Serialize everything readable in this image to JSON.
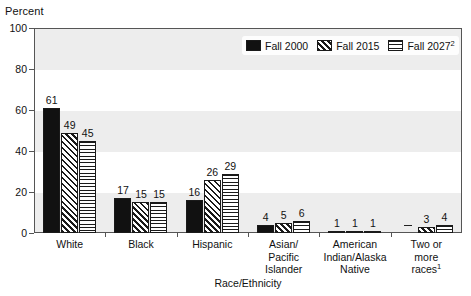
{
  "chart_data": {
    "type": "bar",
    "title": "",
    "xlabel": "Race/Ethnicity",
    "ylabel": "Percent",
    "ylim": [
      0,
      100
    ],
    "ytick_labels": [
      "0",
      "20",
      "40",
      "60",
      "80",
      "100"
    ],
    "ytick_values": [
      0,
      20,
      40,
      60,
      80,
      100
    ],
    "grid": false,
    "banded_background": true,
    "legend_position": "top-right",
    "categories": [
      "White",
      "Black",
      "Hispanic",
      "Asian/ Pacific Islander",
      "American Indian/Alaska Native",
      "Two or more races"
    ],
    "series": [
      {
        "name": "Fall 2000",
        "pattern": "solid",
        "values": [
          61,
          17,
          16,
          4,
          1,
          null
        ],
        "labels": [
          "61",
          "17",
          "16",
          "4",
          "1",
          "—"
        ]
      },
      {
        "name": "Fall 2015",
        "pattern": "diagonal",
        "values": [
          49,
          15,
          26,
          5,
          1,
          3
        ],
        "labels": [
          "49",
          "15",
          "26",
          "5",
          "1",
          "3"
        ]
      },
      {
        "name": "Fall 2027",
        "pattern": "horizontal",
        "values": [
          45,
          15,
          29,
          6,
          1,
          4
        ],
        "labels": [
          "45",
          "15",
          "29",
          "6",
          "1",
          "4"
        ]
      }
    ]
  },
  "axes": {
    "y_title": "Percent",
    "x_title": "Race/Ethnicity",
    "y_ticks": [
      {
        "label": "100",
        "value": 100
      },
      {
        "label": "80",
        "value": 80
      },
      {
        "label": "60",
        "value": 60
      },
      {
        "label": "40",
        "value": 40
      },
      {
        "label": "20",
        "value": 20
      },
      {
        "label": "0",
        "value": 0
      }
    ]
  },
  "legend": {
    "items": [
      {
        "label": "Fall 2000",
        "sup": "",
        "pattern": "solid"
      },
      {
        "label": "Fall 2015",
        "sup": "",
        "pattern": "diag"
      },
      {
        "label": "Fall 2027",
        "sup": "2",
        "pattern": "horiz"
      }
    ]
  },
  "groups": [
    {
      "id": "white",
      "label_lines": [
        "White"
      ],
      "sup": "",
      "bars": [
        {
          "series": "Fall 2000",
          "pattern": "solid",
          "value": 61,
          "label": "61"
        },
        {
          "series": "Fall 2015",
          "pattern": "diag",
          "value": 49,
          "label": "49"
        },
        {
          "series": "Fall 2027",
          "pattern": "horiz",
          "value": 45,
          "label": "45"
        }
      ]
    },
    {
      "id": "black",
      "label_lines": [
        "Black"
      ],
      "sup": "",
      "bars": [
        {
          "series": "Fall 2000",
          "pattern": "solid",
          "value": 17,
          "label": "17"
        },
        {
          "series": "Fall 2015",
          "pattern": "diag",
          "value": 15,
          "label": "15"
        },
        {
          "series": "Fall 2027",
          "pattern": "horiz",
          "value": 15,
          "label": "15"
        }
      ]
    },
    {
      "id": "hispanic",
      "label_lines": [
        "Hispanic"
      ],
      "sup": "",
      "bars": [
        {
          "series": "Fall 2000",
          "pattern": "solid",
          "value": 16,
          "label": "16"
        },
        {
          "series": "Fall 2015",
          "pattern": "diag",
          "value": 26,
          "label": "26"
        },
        {
          "series": "Fall 2027",
          "pattern": "horiz",
          "value": 29,
          "label": "29"
        }
      ]
    },
    {
      "id": "asian-pacific-islander",
      "label_lines": [
        "Asian/",
        "Pacific",
        "Islander"
      ],
      "sup": "",
      "bars": [
        {
          "series": "Fall 2000",
          "pattern": "solid",
          "value": 4,
          "label": "4"
        },
        {
          "series": "Fall 2015",
          "pattern": "diag",
          "value": 5,
          "label": "5"
        },
        {
          "series": "Fall 2027",
          "pattern": "horiz",
          "value": 6,
          "label": "6"
        }
      ]
    },
    {
      "id": "american-indian-alaska-native",
      "label_lines": [
        "American",
        "Indian/Alaska",
        "Native"
      ],
      "sup": "",
      "bars": [
        {
          "series": "Fall 2000",
          "pattern": "solid",
          "value": 1,
          "label": "1"
        },
        {
          "series": "Fall 2015",
          "pattern": "diag",
          "value": 1,
          "label": "1"
        },
        {
          "series": "Fall 2027",
          "pattern": "horiz",
          "value": 1,
          "label": "1"
        }
      ]
    },
    {
      "id": "two-or-more-races",
      "label_lines": [
        "Two or",
        "more",
        "races"
      ],
      "sup": "1",
      "bars": [
        {
          "series": "Fall 2000",
          "pattern": "none",
          "value": 0,
          "label": "—"
        },
        {
          "series": "Fall 2015",
          "pattern": "diag",
          "value": 3,
          "label": "3"
        },
        {
          "series": "Fall 2027",
          "pattern": "horiz",
          "value": 4,
          "label": "4"
        }
      ]
    }
  ],
  "colors": {
    "band": "#ededed",
    "bar_outline": "#1a1a1a",
    "solid_fill": "#111111",
    "axis": "#555555",
    "background": "#ffffff"
  }
}
